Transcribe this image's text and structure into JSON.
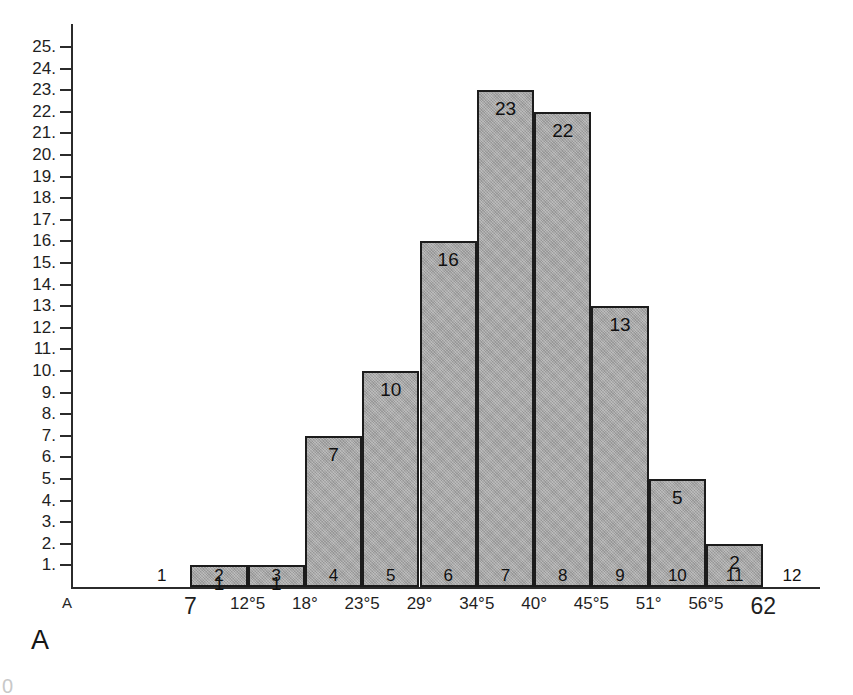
{
  "figure": {
    "caption": "A",
    "origin_letter": "A",
    "edge_glyph": "0"
  },
  "colors": {
    "bar_fill": "#a5a5a5",
    "bar_stroke": "#1c1c1c",
    "axis": "#2b2b2b",
    "text": "#1f1f1f",
    "background": "#ffffff"
  },
  "chart_data": {
    "type": "bar",
    "title": "A",
    "xlabel": "",
    "ylabel": "",
    "grid": false,
    "legend": null,
    "ylim": [
      0,
      25
    ],
    "y_ticks": [
      "25.",
      "24.",
      "23.",
      "22.",
      "21.",
      "20.",
      "19.",
      "18.",
      "17.",
      "16.",
      "15.",
      "14.",
      "13.",
      "12.",
      "11.",
      "10.",
      "9.",
      "8.",
      "7.",
      "6.",
      "5.",
      "4.",
      "3.",
      "2.",
      "1."
    ],
    "y_tick_values": [
      25,
      24,
      23,
      22,
      21,
      20,
      19,
      18,
      17,
      16,
      15,
      14,
      13,
      12,
      11,
      10,
      9,
      8,
      7,
      6,
      5,
      4,
      3,
      2,
      1
    ],
    "categories": [
      "1",
      "2",
      "3",
      "4",
      "5",
      "6",
      "7",
      "8",
      "9",
      "10",
      "11",
      "12"
    ],
    "values": [
      0,
      1,
      1,
      7,
      10,
      16,
      23,
      22,
      13,
      5,
      2,
      0
    ],
    "bar_labels": [
      "",
      "1",
      "1",
      "7",
      "10",
      "16",
      "23",
      "22",
      "13",
      "5",
      "2",
      ""
    ],
    "x_boundary_labels": [
      "7",
      "12°5",
      "18°",
      "23°5",
      "29°",
      "34°5",
      "40°",
      "45°5",
      "51°",
      "56°5",
      "62"
    ],
    "x_boundary_emphasis": [
      true,
      false,
      false,
      false,
      false,
      false,
      false,
      false,
      false,
      false,
      true
    ]
  }
}
